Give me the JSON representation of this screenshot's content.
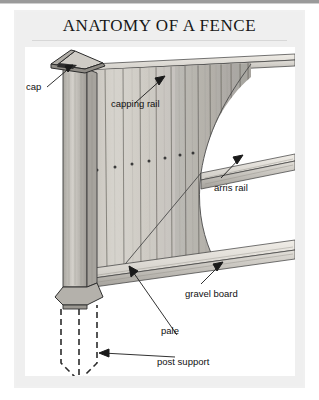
{
  "page": {
    "title": "ANATOMY OF A FENCE",
    "background_color": "#f0f0f0",
    "plate_color": "#ffffff",
    "ink_color": "#111111"
  },
  "illustration": {
    "name": "fence-cutaway-diagram",
    "description": "Cutaway perspective line drawing of a timber fence showing post with cap, capping rail, vertical pales, arris rail, gravel board and buried post support",
    "wood_tone": "#c9c6c0",
    "shadow_tone": "#8d8a85",
    "line_color": "#2b2b2b"
  },
  "labels": [
    {
      "id": "cap",
      "text": "cap"
    },
    {
      "id": "capping-rail",
      "text": "capping rail"
    },
    {
      "id": "arris-rail",
      "text": "arris rail"
    },
    {
      "id": "gravel-board",
      "text": "gravel board"
    },
    {
      "id": "pale",
      "text": "pale"
    },
    {
      "id": "post-support",
      "text": "post support"
    }
  ]
}
